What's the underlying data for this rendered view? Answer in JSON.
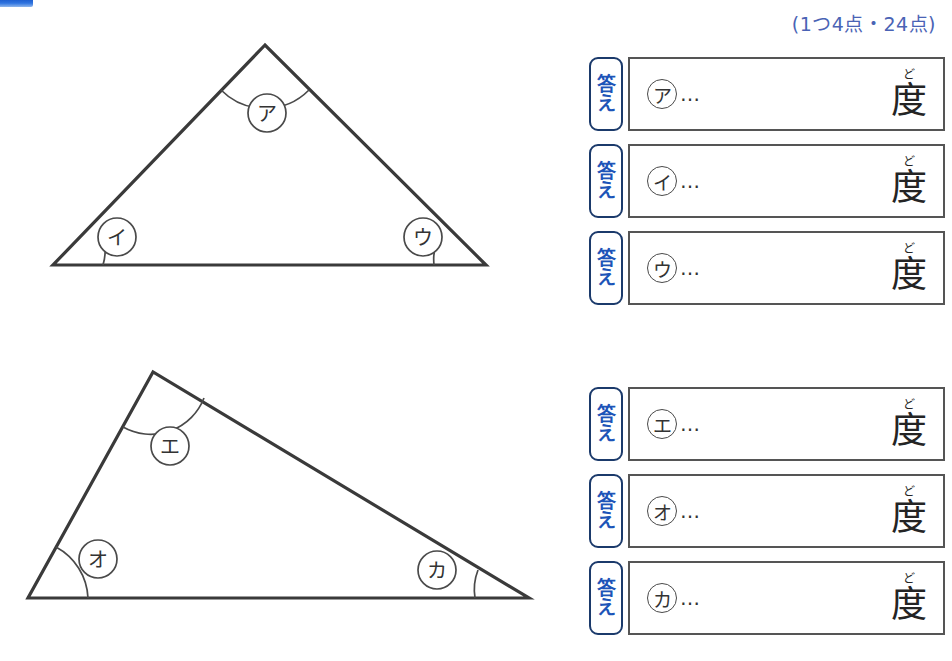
{
  "page": {
    "header_fragment_color": "#2f74e0",
    "background": "#ffffff"
  },
  "score_note": {
    "text": "(1つ4点・24点)",
    "color": "#4a63b5"
  },
  "figures": [
    {
      "name": "triangle-1",
      "type": "acute-isosceles-like-triangle",
      "vertices": [
        {
          "label": "ア",
          "x": 265,
          "y": 45
        },
        {
          "label": "イ",
          "x": 53,
          "y": 265
        },
        {
          "label": "ウ",
          "x": 486,
          "y": 265
        }
      ],
      "angle_labels": [
        {
          "label": "ア",
          "cx": 267,
          "cy": 113
        },
        {
          "label": "イ",
          "cx": 117,
          "cy": 237
        },
        {
          "label": "ウ",
          "cx": 423,
          "cy": 237
        }
      ]
    },
    {
      "name": "triangle-2",
      "type": "scalene-triangle",
      "vertices": [
        {
          "label": "エ",
          "x": 153,
          "y": 372
        },
        {
          "label": "オ",
          "x": 28,
          "y": 598
        },
        {
          "label": "カ",
          "x": 529,
          "y": 598
        }
      ],
      "angle_labels": [
        {
          "label": "エ",
          "cx": 170,
          "cy": 446
        },
        {
          "label": "オ",
          "cx": 96,
          "cy": 559
        },
        {
          "label": "カ",
          "cx": 437,
          "cy": 570
        }
      ]
    }
  ],
  "answer_groups": [
    {
      "group": "upper",
      "rows": [
        {
          "tag_chars": [
            "答",
            "え"
          ],
          "marker": "ア",
          "dots": "…",
          "unit_ruby": "ど",
          "unit_kanji": "度",
          "value": ""
        },
        {
          "tag_chars": [
            "答",
            "え"
          ],
          "marker": "イ",
          "dots": "…",
          "unit_ruby": "ど",
          "unit_kanji": "度",
          "value": ""
        },
        {
          "tag_chars": [
            "答",
            "え"
          ],
          "marker": "ウ",
          "dots": "…",
          "unit_ruby": "ど",
          "unit_kanji": "度",
          "value": ""
        }
      ]
    },
    {
      "group": "lower",
      "rows": [
        {
          "tag_chars": [
            "答",
            "え"
          ],
          "marker": "エ",
          "dots": "…",
          "unit_ruby": "ど",
          "unit_kanji": "度",
          "value": ""
        },
        {
          "tag_chars": [
            "答",
            "え"
          ],
          "marker": "オ",
          "dots": "…",
          "unit_ruby": "ど",
          "unit_kanji": "度",
          "value": ""
        },
        {
          "tag_chars": [
            "答",
            "え"
          ],
          "marker": "カ",
          "dots": "…",
          "unit_ruby": "ど",
          "unit_kanji": "度",
          "value": ""
        }
      ]
    }
  ],
  "answer_rows_flat": [
    {
      "tag_top": "答",
      "tag_bottom": "え",
      "marker": "ア",
      "dots": "…",
      "unit_ruby": "ど",
      "unit_kanji": "度"
    },
    {
      "tag_top": "答",
      "tag_bottom": "え",
      "marker": "イ",
      "dots": "…",
      "unit_ruby": "ど",
      "unit_kanji": "度"
    },
    {
      "tag_top": "答",
      "tag_bottom": "え",
      "marker": "ウ",
      "dots": "…",
      "unit_ruby": "ど",
      "unit_kanji": "度"
    },
    {
      "tag_top": "答",
      "tag_bottom": "え",
      "marker": "エ",
      "dots": "…",
      "unit_ruby": "ど",
      "unit_kanji": "度"
    },
    {
      "tag_top": "答",
      "tag_bottom": "え",
      "marker": "オ",
      "dots": "…",
      "unit_ruby": "ど",
      "unit_kanji": "度"
    },
    {
      "tag_top": "答",
      "tag_bottom": "え",
      "marker": "カ",
      "dots": "…",
      "unit_ruby": "ど",
      "unit_kanji": "度"
    }
  ]
}
